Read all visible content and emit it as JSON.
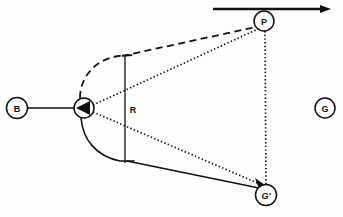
{
  "figure": {
    "title": "",
    "background_color": "#fdfdfb",
    "ink_color": "#111111",
    "nodes": [
      {
        "id": "B",
        "label": "B",
        "cx": 17,
        "cy": 108,
        "r": 10.5,
        "name": "node-b"
      },
      {
        "id": "V",
        "label": "",
        "cx": 84,
        "cy": 108,
        "r": 10.0,
        "name": "node-vertex"
      },
      {
        "id": "P",
        "label": "P",
        "cx": 264,
        "cy": 21,
        "r": 10.0,
        "name": "node-p"
      },
      {
        "id": "Gp",
        "label": "G'",
        "cx": 266,
        "cy": 195,
        "r": 10.5,
        "name": "node-g-prime"
      },
      {
        "id": "G",
        "label": "G",
        "cx": 325,
        "cy": 108,
        "r": 10.0,
        "name": "node-g"
      }
    ],
    "dimension_labels": [
      {
        "text": "R",
        "x": 133,
        "y": 110,
        "name": "radius-label-r"
      }
    ],
    "edges": [
      {
        "name": "edge-b-to-vertex",
        "style": "solid",
        "from": "B",
        "to": "V"
      },
      {
        "name": "edge-dashed-arc-to-vertex",
        "style": "dashed",
        "from": "arc-top",
        "to": "V"
      },
      {
        "name": "edge-dashed-arc-to-p",
        "style": "dashed",
        "from": "arc-top",
        "to": "P"
      },
      {
        "name": "edge-dotted-vertex-to-p",
        "style": "dotted",
        "from": "V",
        "to": "P"
      },
      {
        "name": "edge-dotted-vertex-to-gprime",
        "style": "dotted",
        "from": "V",
        "to": "Gp"
      },
      {
        "name": "edge-dotted-p-to-gprime",
        "style": "dotted",
        "from": "P",
        "to": "Gp"
      },
      {
        "name": "edge-solid-arc-to-gprime",
        "style": "solid",
        "from": "arc-bottom",
        "to": "Gp"
      },
      {
        "name": "radius-line",
        "style": "solid",
        "from": "arc-top",
        "to": "arc-bottom"
      }
    ],
    "motion_arrow": {
      "name": "motion-arrow",
      "x_start": 213,
      "x_end": 331,
      "y": 9,
      "direction": "right"
    },
    "arrowheads": [
      {
        "name": "arrowhead-into-vertex",
        "at": "V",
        "direction": "left"
      },
      {
        "name": "arrowhead-into-gprime",
        "at": "Gp",
        "direction": "down-right"
      },
      {
        "name": "arrowhead-motion-right",
        "at": "motion-arrow",
        "direction": "right"
      }
    ]
  }
}
